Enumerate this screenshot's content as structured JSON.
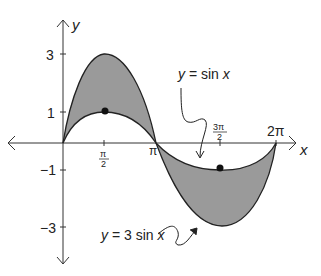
{
  "figure": {
    "type": "function graph",
    "axes": {
      "x_label": "x",
      "y_label": "y",
      "x_ticks": [
        "π/2",
        "π",
        "3π/2",
        "2π"
      ],
      "y_ticks": [
        "3",
        "1",
        "−1",
        "−3"
      ]
    },
    "curves": [
      {
        "label": "y = sin x",
        "function": "sin x",
        "amplitude": 1,
        "marked_points": [
          [
            "π/2",
            1
          ],
          [
            "3π/2",
            -1
          ]
        ]
      },
      {
        "label": "y = 3 sin x",
        "function": "3 sin x",
        "amplitude": 3
      }
    ],
    "shading": "region between y = sin x and y = 3 sin x over [0, 2π]",
    "colors": {
      "fill": "#9a9a9a",
      "stroke": "#222222",
      "background": "#ffffff"
    }
  },
  "labels": {
    "y_axis": "y",
    "x_axis": "x",
    "y3": "3",
    "y1": "1",
    "ym1": "−1",
    "ym3": "−3",
    "pi_over_2_num": "π",
    "pi_over_2_den": "2",
    "pi": "π",
    "three_pi_over_2_num": "3π",
    "three_pi_over_2_den": "2",
    "two_pi": "2π",
    "sin_label": "y = sin x",
    "three_sin_label": "y = 3 sin x"
  }
}
